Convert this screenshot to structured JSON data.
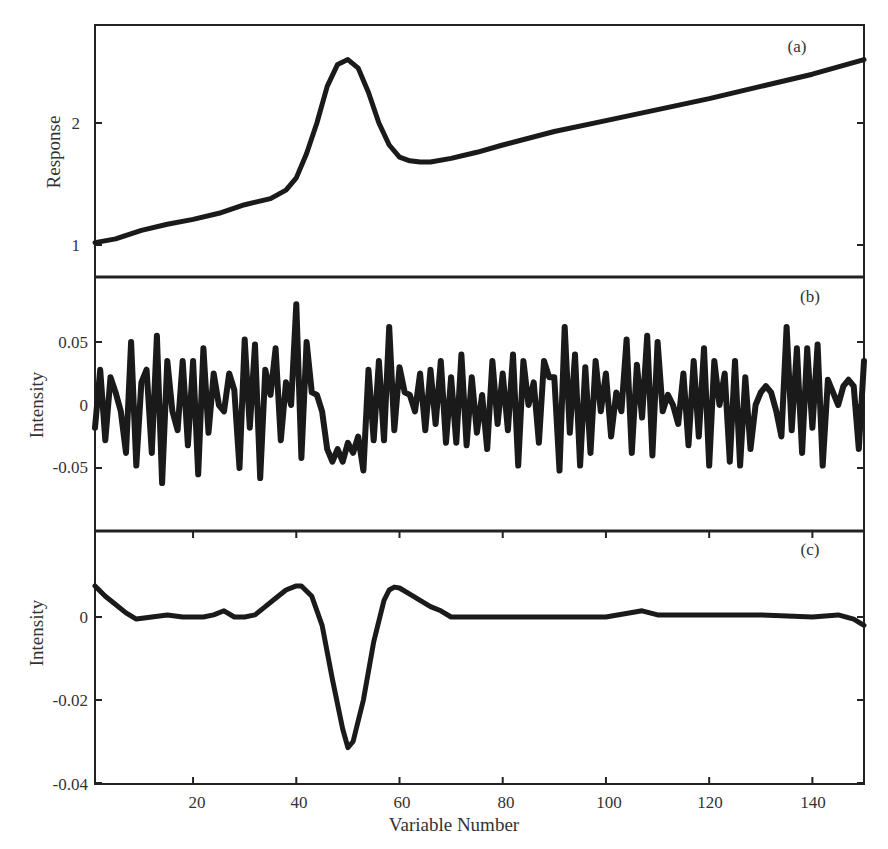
{
  "chart_data": [
    {
      "panel": "(a)",
      "type": "line",
      "title": "",
      "xlabel": "",
      "ylabel": "Response",
      "xlim": [
        1,
        150
      ],
      "ylim": [
        0.75,
        2.8
      ],
      "yticks": [
        1,
        2
      ],
      "ytick_labels": [
        "1",
        "2"
      ],
      "grid": false,
      "description": "Linearly rising baseline from ~1.02 to ~2.52 with a Gaussian peak centered at variable ~50 (peak ~2.52), dip minimum ~1.68 near variable 63",
      "x": [
        1,
        5,
        10,
        15,
        20,
        25,
        30,
        35,
        38,
        40,
        42,
        44,
        46,
        48,
        50,
        52,
        54,
        56,
        58,
        60,
        62,
        64,
        66,
        70,
        75,
        80,
        90,
        100,
        110,
        120,
        130,
        140,
        145,
        150
      ],
      "values": [
        1.02,
        1.05,
        1.12,
        1.17,
        1.21,
        1.26,
        1.33,
        1.38,
        1.45,
        1.55,
        1.75,
        2.0,
        2.3,
        2.48,
        2.52,
        2.45,
        2.25,
        2.0,
        1.82,
        1.72,
        1.69,
        1.68,
        1.68,
        1.71,
        1.76,
        1.82,
        1.93,
        2.02,
        2.11,
        2.2,
        2.3,
        2.4,
        2.46,
        2.52
      ]
    },
    {
      "panel": "(b)",
      "type": "line",
      "title": "",
      "xlabel": "",
      "ylabel": "Intensity",
      "xlim": [
        1,
        150
      ],
      "ylim": [
        -0.1,
        0.1
      ],
      "yticks": [
        0.05,
        0,
        -0.05
      ],
      "ytick_labels": [
        "0.05",
        "0",
        "-0.05"
      ],
      "grid": false,
      "description": "High-frequency noise around 0 (±0.06), max ~0.08 at variable 40, negative excursion ~-0.04 at variables 44-53",
      "x": [
        1,
        2,
        3,
        4,
        5,
        6,
        7,
        8,
        9,
        10,
        11,
        12,
        13,
        14,
        15,
        16,
        17,
        18,
        19,
        20,
        21,
        22,
        23,
        24,
        25,
        26,
        27,
        28,
        29,
        30,
        31,
        32,
        33,
        34,
        35,
        36,
        37,
        38,
        39,
        40,
        41,
        42,
        43,
        44,
        45,
        46,
        47,
        48,
        49,
        50,
        51,
        52,
        53,
        54,
        55,
        56,
        57,
        58,
        59,
        60,
        61,
        62,
        63,
        64,
        65,
        66,
        67,
        68,
        69,
        70,
        71,
        72,
        73,
        74,
        75,
        76,
        77,
        78,
        79,
        80,
        81,
        82,
        83,
        84,
        85,
        86,
        87,
        88,
        89,
        90,
        91,
        92,
        93,
        94,
        95,
        96,
        97,
        98,
        99,
        100,
        101,
        102,
        103,
        104,
        105,
        106,
        107,
        108,
        109,
        110,
        111,
        112,
        113,
        114,
        115,
        116,
        117,
        118,
        119,
        120,
        121,
        122,
        123,
        124,
        125,
        126,
        127,
        128,
        129,
        130,
        131,
        132,
        133,
        134,
        135,
        136,
        137,
        138,
        139,
        140,
        141,
        142,
        143,
        144,
        145,
        146,
        147,
        148,
        149,
        150
      ],
      "values": [
        -0.018,
        0.028,
        -0.028,
        0.022,
        0.01,
        -0.005,
        -0.038,
        0.05,
        -0.048,
        0.018,
        0.028,
        -0.038,
        0.055,
        -0.062,
        0.035,
        -0.005,
        -0.02,
        0.035,
        -0.032,
        0.035,
        -0.055,
        0.045,
        -0.022,
        0.025,
        0.0,
        -0.005,
        0.025,
        0.012,
        -0.05,
        0.052,
        -0.018,
        0.048,
        -0.058,
        0.028,
        0.008,
        0.045,
        -0.028,
        0.018,
        0.0,
        0.08,
        -0.042,
        0.05,
        0.01,
        0.008,
        -0.005,
        -0.035,
        -0.045,
        -0.035,
        -0.045,
        -0.03,
        -0.038,
        -0.025,
        -0.052,
        0.028,
        -0.028,
        0.035,
        -0.028,
        0.062,
        -0.02,
        0.03,
        0.01,
        0.008,
        -0.005,
        0.025,
        -0.02,
        0.028,
        -0.015,
        0.035,
        -0.03,
        0.022,
        -0.03,
        0.04,
        -0.032,
        0.022,
        -0.022,
        0.008,
        -0.035,
        0.035,
        -0.015,
        0.025,
        -0.02,
        0.04,
        -0.048,
        0.035,
        0.0,
        0.018,
        -0.03,
        0.035,
        0.022,
        0.022,
        -0.052,
        0.062,
        -0.022,
        0.04,
        -0.048,
        0.03,
        -0.038,
        0.035,
        -0.005,
        0.025,
        -0.025,
        0.01,
        -0.005,
        0.052,
        -0.038,
        0.032,
        -0.01,
        0.055,
        -0.04,
        0.05,
        -0.005,
        0.008,
        0.0,
        -0.015,
        0.025,
        -0.032,
        0.035,
        -0.025,
        0.045,
        -0.048,
        0.035,
        0.0,
        0.025,
        -0.045,
        0.035,
        -0.048,
        0.022,
        -0.035,
        0.0,
        0.01,
        0.015,
        0.01,
        -0.005,
        -0.025,
        0.062,
        -0.02,
        0.045,
        -0.038,
        0.045,
        -0.018,
        0.048,
        -0.048,
        0.02,
        0.01,
        0.0,
        0.015,
        0.02,
        0.015,
        -0.035,
        0.035,
        0.0,
        0.0
      ]
    },
    {
      "panel": "(c)",
      "type": "line",
      "title": "",
      "xlabel": "Variable Number",
      "ylabel": "Intensity",
      "xlim": [
        1,
        150
      ],
      "ylim": [
        -0.04,
        0.02
      ],
      "xticks": [
        20,
        40,
        60,
        80,
        100,
        120,
        140
      ],
      "xtick_labels": [
        "20",
        "40",
        "60",
        "80",
        "100",
        "120",
        "140"
      ],
      "yticks": [
        0,
        -0.02,
        -0.04
      ],
      "ytick_labels": [
        "0",
        "-0.02",
        "-0.04"
      ],
      "grid": false,
      "description": "Smooth derivative-like curve near 0 with positive lobes (~0.0075) at variables 40 and 59 and a deep trough (~-0.0315) at variable 50",
      "x": [
        1,
        3,
        5,
        7,
        9,
        12,
        15,
        18,
        20,
        22,
        24,
        26,
        28,
        30,
        32,
        34,
        36,
        38,
        40,
        41,
        43,
        45,
        47,
        49,
        50,
        51,
        53,
        55,
        57,
        58,
        59,
        60,
        62,
        64,
        66,
        68,
        70,
        75,
        80,
        90,
        100,
        107,
        110,
        120,
        130,
        140,
        145,
        148,
        150
      ],
      "values": [
        0.0075,
        0.005,
        0.003,
        0.001,
        -0.0005,
        0.0,
        0.0005,
        0.0,
        0.0,
        0.0,
        0.0005,
        0.0015,
        0.0,
        0.0,
        0.0005,
        0.0025,
        0.0045,
        0.0065,
        0.0075,
        0.0075,
        0.005,
        -0.002,
        -0.015,
        -0.027,
        -0.0315,
        -0.03,
        -0.02,
        -0.006,
        0.004,
        0.0065,
        0.0072,
        0.007,
        0.0055,
        0.004,
        0.0025,
        0.0015,
        0.0,
        0.0,
        0.0,
        0.0,
        0.0,
        0.0015,
        0.0005,
        0.0005,
        0.0005,
        0.0,
        0.0005,
        -0.0005,
        -0.002
      ]
    }
  ],
  "figure": {
    "panel_labels": [
      "(a)",
      "(b)",
      "(c)"
    ],
    "y_axis_labels": [
      "Response",
      "Intensity",
      "Intensity"
    ],
    "x_axis_label": "Variable Number",
    "panel_a_ticks": [
      "2",
      "1"
    ],
    "panel_b_ticks": [
      "0.05",
      "0",
      "-0.05"
    ],
    "panel_c_ticks": [
      "0",
      "-0.02",
      "-0.04"
    ],
    "x_ticks": [
      "20",
      "40",
      "60",
      "80",
      "100",
      "120",
      "140"
    ],
    "line_color": "#1a1a1a",
    "frame_color": "#222222"
  }
}
